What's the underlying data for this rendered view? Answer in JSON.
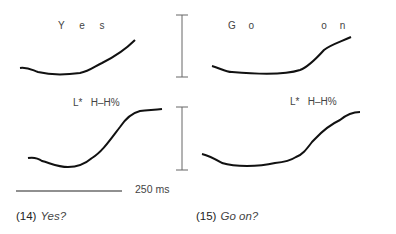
{
  "panels": [
    {
      "id": "14-top",
      "label": "Y e s"
    },
    {
      "id": "15-top",
      "label": "G o        o n"
    },
    {
      "id": "14-bottom",
      "label": "L*   H–H%"
    },
    {
      "id": "15-bottom",
      "label": "L*   H–H%"
    }
  ],
  "scale": {
    "time_label": "250 ms"
  },
  "captions": [
    {
      "number": "(14)",
      "text": "Yes?"
    },
    {
      "number": "(15)",
      "text": "Go on?"
    }
  ]
}
